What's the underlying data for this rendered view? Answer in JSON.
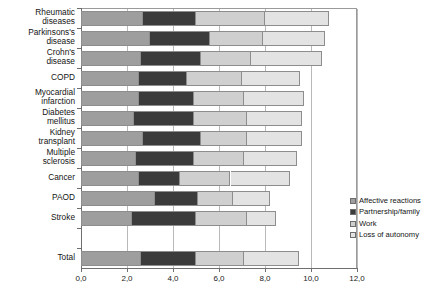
{
  "chart_data": {
    "type": "bar",
    "orientation": "horizontal",
    "stacked": true,
    "title": "",
    "subtitle": "",
    "xlabel": "",
    "ylabel": "",
    "xlim": [
      0.0,
      12.0
    ],
    "xticks": [
      0.0,
      2.0,
      4.0,
      6.0,
      8.0,
      10.0,
      12.0
    ],
    "xtick_labels": [
      "0,0",
      "2,0",
      "4,0",
      "6,0",
      "8,0",
      "10,0",
      "12,0"
    ],
    "grid": true,
    "grid_axis": "x",
    "legend_position": "right-bottom",
    "decimal_separator": ",",
    "categories": [
      "Rheumatic\ndiseases",
      "Parkinsons's\ndisease",
      "Crohn's\ndisease",
      "COPD",
      "Myocardial\ninfarction",
      "Diabetes\nmellitus",
      "Kidney\ntransplant",
      "Multiple\nsclerosis",
      "Cancer",
      "PAOD",
      "Stroke",
      "",
      "Total"
    ],
    "series": [
      {
        "name": "Affective reactions",
        "color": "#9e9e9e",
        "values": [
          2.7,
          3.0,
          2.6,
          2.5,
          2.5,
          2.3,
          2.7,
          2.4,
          2.5,
          3.2,
          2.2,
          null,
          2.6
        ]
      },
      {
        "name": "Partnership/family",
        "color": "#3b3b3b",
        "values": [
          2.3,
          2.6,
          2.6,
          2.1,
          2.4,
          2.6,
          2.5,
          2.5,
          1.8,
          1.9,
          2.8,
          null,
          2.4
        ]
      },
      {
        "name": "Work",
        "color": "#cfcfcf",
        "values": [
          3.0,
          2.3,
          2.2,
          2.4,
          2.2,
          2.3,
          2.0,
          2.2,
          2.2,
          1.5,
          2.2,
          null,
          2.1
        ]
      },
      {
        "name": "Loss of autonomy",
        "color": "#e3e3e3",
        "values": [
          2.8,
          2.7,
          3.1,
          2.5,
          2.6,
          2.4,
          2.4,
          2.3,
          2.6,
          1.6,
          1.3,
          null,
          2.4
        ]
      }
    ],
    "totals": [
      10.8,
      10.6,
      10.5,
      9.5,
      9.7,
      9.6,
      9.6,
      9.4,
      9.1,
      8.2,
      8.5,
      null,
      9.5
    ],
    "legend": [
      {
        "label": "Affective reactions",
        "color": "#9e9e9e"
      },
      {
        "label": "Partnership/family",
        "color": "#3b3b3b"
      },
      {
        "label": "Work",
        "color": "#cfcfcf"
      },
      {
        "label": "Loss of autonomy",
        "color": "#e3e3e3"
      }
    ]
  }
}
